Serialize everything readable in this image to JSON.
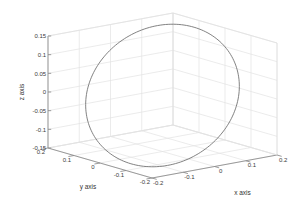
{
  "figure": {
    "background_color": "#ffffff",
    "plot_type": "3d-line",
    "box_color": "#8a8a8a",
    "grid_color": "#e2e2e2",
    "curve_color": "#6b6b6b",
    "text_color": "#3a3a3a"
  },
  "chart_data": {
    "type": "line",
    "title": "",
    "projection": "3d",
    "xlabel": "x axis",
    "ylabel": "y axis",
    "zlabel": "z axis",
    "xlim": [
      -0.2,
      0.2
    ],
    "ylim": [
      -0.2,
      0.2
    ],
    "zlim": [
      -0.15,
      0.15
    ],
    "xticks": [
      -0.2,
      -0.1,
      0,
      0.1,
      0.2
    ],
    "yticks": [
      -0.2,
      -0.1,
      0,
      0.1,
      0.2
    ],
    "zticks": [
      -0.15,
      -0.1,
      -0.05,
      0,
      0.05,
      0.1,
      0.15
    ],
    "xticklabels": [
      "-0.2",
      "-0.1",
      "0",
      "0.1",
      "0.2"
    ],
    "yticklabels": [
      "-0.2",
      "-0.1",
      "0",
      "0.1",
      "0.2"
    ],
    "zticklabels": [
      "-0.15",
      "-0.1",
      "-0.05",
      "0",
      "0.05",
      "0.1",
      "0.15"
    ],
    "grid": true,
    "legend": null,
    "series": [
      {
        "name": "circular orbit",
        "description": "closed tilted circle of radius 0.2 in 3D space",
        "radius": 0.2,
        "npoints": 180,
        "plane_u": [
          0.62,
          0.0,
          0.7847
        ],
        "plane_v": [
          -0.2874,
          0.9306,
          0.2271
        ],
        "center": [
          0,
          0,
          0
        ]
      }
    ]
  },
  "view": {
    "azimuth_deg": -37.5,
    "elevation_deg": 30
  },
  "labels": {
    "x_axis": "x axis",
    "y_axis": "y axis",
    "z_axis": "z axis"
  }
}
